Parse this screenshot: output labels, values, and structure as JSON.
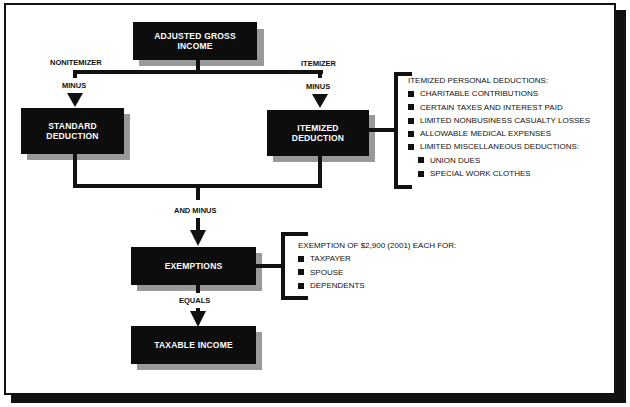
{
  "diagram": {
    "nodes": {
      "agi": {
        "line1": "ADJUSTED GROSS",
        "line2": "INCOME"
      },
      "standard": {
        "line1": "STANDARD",
        "line2": "DEDUCTION"
      },
      "itemized": {
        "line1": "ITEMIZED",
        "line2": "DEDUCTION"
      },
      "exemptions": {
        "label": "EXEMPTIONS"
      },
      "taxable": {
        "label": "TAXABLE INCOME"
      }
    },
    "labels": {
      "nonitemizer": "NONITEMIZER",
      "itemizer": "ITEMIZER",
      "minus_left": "MINUS",
      "minus_right": "MINUS",
      "and_minus": "AND MINUS",
      "equals": "EQUALS"
    },
    "itemized_list": {
      "title": "ITEMIZED PERSONAL DEDUCTIONS:",
      "items": [
        "CHARITABLE CONTRIBUTIONS",
        "CERTAIN TAXES AND INTEREST PAID",
        "LIMITED NONBUSINESS CASUALTY LOSSES",
        "ALLOWABLE MEDICAL EXPENSES",
        "LIMITED MISCELLANEOUS DEDUCTIONS:"
      ],
      "subitems": [
        "UNION DUES",
        "SPECIAL WORK CLOTHES"
      ]
    },
    "exemption_list": {
      "title": "EXEMPTION OF $2,900 (2001) EACH FOR:",
      "items": [
        "TAXPAYER",
        "SPOUSE",
        "DEPENDENTS"
      ]
    }
  }
}
